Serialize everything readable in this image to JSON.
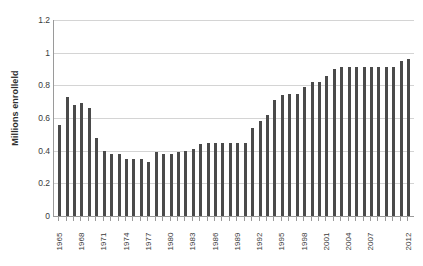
{
  "chart_data": {
    "type": "bar",
    "title": "",
    "xlabel": "",
    "ylabel": "Millions enrolleld",
    "ylim": [
      0,
      1.2
    ],
    "yticks": [
      0,
      0.2,
      0.4,
      0.6,
      0.8,
      1,
      1.2
    ],
    "ytick_labels": [
      "0",
      "0.2",
      "0.4",
      "0.6",
      "0.8",
      "1",
      "1.2"
    ],
    "grid": true,
    "legend": null,
    "bar_color": "#4a4a4a",
    "gridline_color": "#d4d4d4",
    "axis_color": "#9a9a9a",
    "xtick_label_interval": 3,
    "xtick_labels_shown": [
      "1965",
      "1968",
      "1971",
      "1974",
      "1977",
      "1980",
      "1983",
      "1986",
      "1989",
      "1992",
      "1995",
      "1998",
      "2001",
      "2004",
      "2007",
      "2012"
    ],
    "categories": [
      "1965",
      "1966",
      "1967",
      "1968",
      "1969",
      "1970",
      "1971",
      "1972",
      "1973",
      "1974",
      "1975",
      "1976",
      "1977",
      "1978",
      "1979",
      "1980",
      "1981",
      "1982",
      "1983",
      "1984",
      "1985",
      "1986",
      "1987",
      "1988",
      "1989",
      "1990",
      "1991",
      "1992",
      "1993",
      "1994",
      "1995",
      "1996",
      "1997",
      "1998",
      "1999",
      "2000",
      "2001",
      "2002",
      "2003",
      "2004",
      "2005",
      "2006",
      "2007",
      "2008",
      "2009",
      "2010",
      "2011",
      "2012"
    ],
    "values": [
      0.56,
      0.73,
      0.68,
      0.69,
      0.66,
      0.48,
      0.4,
      0.38,
      0.38,
      0.35,
      0.35,
      0.35,
      0.33,
      0.39,
      0.38,
      0.38,
      0.39,
      0.4,
      0.41,
      0.44,
      0.45,
      0.45,
      0.45,
      0.45,
      0.45,
      0.45,
      0.54,
      0.58,
      0.62,
      0.71,
      0.74,
      0.75,
      0.75,
      0.79,
      0.82,
      0.82,
      0.86,
      0.9,
      0.91,
      0.91,
      0.91,
      0.91,
      0.91,
      0.91,
      0.91,
      0.91,
      0.95,
      0.96
    ]
  }
}
